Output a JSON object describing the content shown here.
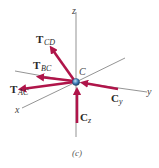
{
  "diagram": {
    "caption": "(c)",
    "point_label": "C",
    "axes": {
      "x": "x",
      "y": "y",
      "z": "z"
    },
    "forces": {
      "T_CD": {
        "main": "T",
        "sub": "CD"
      },
      "T_BC": {
        "main": "T",
        "sub": "BC"
      },
      "T_AC": {
        "main": "T",
        "sub": "AC"
      },
      "C_y": {
        "main": "C",
        "sub": "y"
      },
      "C_z": {
        "main": "C",
        "sub": "z"
      }
    },
    "colors": {
      "arrow": "#b0154a",
      "axis": "#555555",
      "joint": "#3a78b5"
    }
  }
}
